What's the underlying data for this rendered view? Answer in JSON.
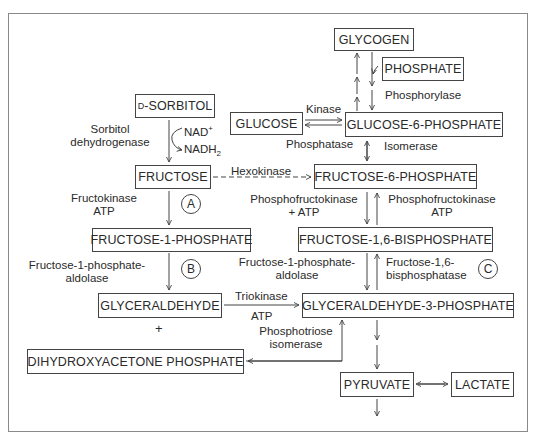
{
  "diagram": {
    "metabolites": {
      "glycogen": "GLYCOGEN",
      "phosphate": "PHOSPHATE",
      "glucose": "GLUCOSE",
      "glucose_6_phosphate": "GLUCOSE-6-PHOSPHATE",
      "sorbitol_prefix": "D",
      "sorbitol": "-SORBITOL",
      "fructose": "FRUCTOSE",
      "fructose_6_phosphate": "FRUCTOSE-6-PHOSPHATE",
      "fructose_1_phosphate": "FRUCTOSE-1-PHOSPHATE",
      "fructose_1_6_bisphosphate": "FRUCTOSE-1,6-BISPHOSPHATE",
      "glyceraldehyde": "GLYCERALDEHYDE",
      "glyceraldehyde_3_phosphate": "GLYCERALDEHYDE-3-PHOSPHATE",
      "dihydroxyacetone_phosphate": "DIHYDROXYACETONE PHOSPHATE",
      "pyruvate": "PYRUVATE",
      "lactate": "LACTATE"
    },
    "enzymes": {
      "phosphorylase": "Phosphorylase",
      "kinase": "Kinase",
      "phosphatase": "Phosphatase",
      "isomerase": "Isomerase",
      "sorbitol_dh_line1": "Sorbitol",
      "sorbitol_dh_line2": "dehydrogenase",
      "nad": "NAD",
      "nad_sup": "+",
      "nadh": "NADH",
      "nadh_sub": "2",
      "hexokinase": "Hexokinase",
      "fructokinase": "Fructokinase",
      "fructokinase_cofactor": "ATP",
      "pfk_left_line1": "Phosphofructokinase",
      "pfk_left_line2": "+ ATP",
      "pfk_right_line1": "Phosphofructokinase",
      "pfk_right_line2": "ATP",
      "f1p_aldolase_left_line1": "Fructose-1-phosphate-",
      "f1p_aldolase_left_line2": "aldolase",
      "f1p_aldolase_mid_line1": "Fructose-1-phosphate-",
      "f1p_aldolase_mid_line2": "aldolase",
      "fbpase_line1": "Fructose-1,6-",
      "fbpase_line2": "bisphosphatase",
      "triokinase": "Triokinase",
      "triokinase_cofactor": "ATP",
      "tpi_line1": "Phosphotriose",
      "tpi_line2": "isomerase",
      "plus": "+"
    },
    "markers": {
      "a": "A",
      "b": "B",
      "c": "C"
    },
    "colors": {
      "line": "#444444",
      "frame": "#8a8a8a",
      "text": "#2a2a2a",
      "background": "#ffffff"
    }
  }
}
